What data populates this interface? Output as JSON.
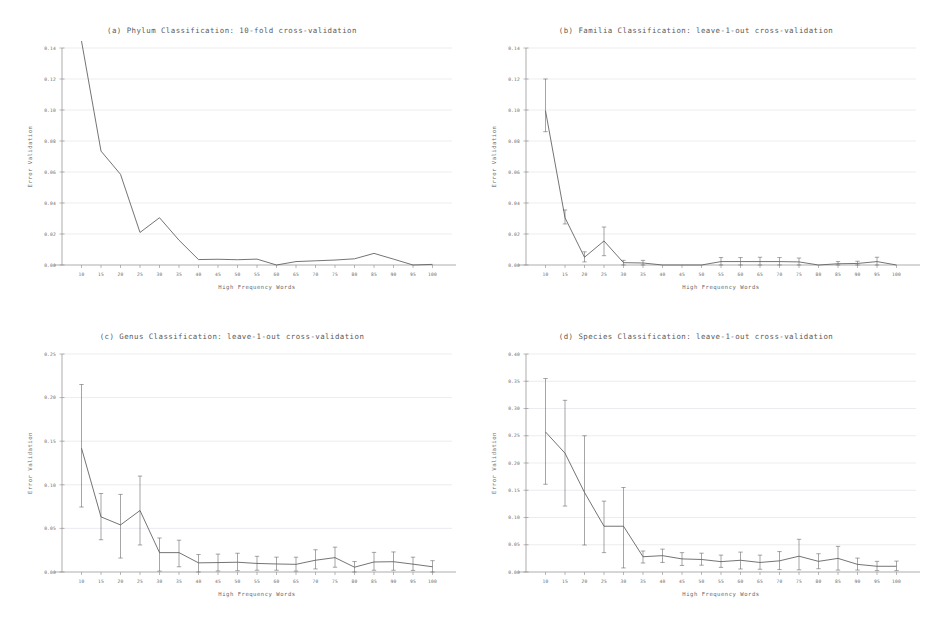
{
  "figure": {
    "axis_x_label": "High Frequency Words",
    "axis_y_label": "Error Validation",
    "x_ticks": [
      10,
      15,
      20,
      25,
      30,
      35,
      40,
      45,
      50,
      55,
      60,
      65,
      70,
      75,
      80,
      85,
      90,
      95,
      100
    ],
    "line_color": "#5b5b5b",
    "grid_color": "#c9cfd6",
    "axis_color": "#8a8a8a"
  },
  "chart_data": [
    {
      "id": "panel-a",
      "type": "line",
      "title": "(a) Phylum Classification: 10-fold cross-validation",
      "xlabel": "High Frequency Words",
      "ylabel": "Error Validation",
      "x": [
        10,
        15,
        20,
        25,
        30,
        35,
        40,
        45,
        50,
        55,
        60,
        65,
        70,
        75,
        80,
        85,
        90,
        95,
        100
      ],
      "values": [
        0.1445,
        0.0735,
        0.0585,
        0.021,
        0.0305,
        0.016,
        0.0035,
        0.0037,
        0.0034,
        0.0038,
        0.0,
        0.0022,
        0.0027,
        0.0032,
        0.004,
        0.0075,
        0.0038,
        0.0,
        0.0004
      ],
      "errors": null,
      "xlim": [
        5,
        105
      ],
      "ylim": [
        0.0,
        0.14
      ],
      "y_ticks": [
        0.0,
        0.02,
        0.04,
        0.06,
        0.08,
        0.1,
        0.12,
        0.14
      ],
      "y_tick_labels": [
        "0.00",
        "0.02",
        "0.04",
        "0.06",
        "0.08",
        "0.10",
        "0.12",
        "0.14"
      ],
      "grid": true,
      "legend": "none"
    },
    {
      "id": "panel-b",
      "type": "line",
      "title": "(b) Familia Classification: leave-1-out cross-validation",
      "xlabel": "High Frequency Words",
      "ylabel": "Error Validation",
      "x": [
        10,
        15,
        20,
        25,
        30,
        35,
        40,
        45,
        50,
        55,
        60,
        65,
        70,
        75,
        80,
        85,
        90,
        95,
        100
      ],
      "values": [
        0.0995,
        0.0305,
        0.005,
        0.0155,
        0.0015,
        0.0013,
        0.0,
        0.0,
        0.0,
        0.0022,
        0.0022,
        0.0022,
        0.0022,
        0.002,
        0.0,
        0.0008,
        0.001,
        0.0022,
        0.0
      ],
      "errors": [
        [
          0.086,
          0.12
        ],
        [
          0.0265,
          0.0355
        ],
        [
          0.002,
          0.0085
        ],
        [
          0.006,
          0.0245
        ],
        [
          0.0,
          0.003
        ],
        [
          0.0,
          0.003
        ],
        [
          0.0,
          0.0
        ],
        [
          0.0,
          0.0
        ],
        [
          0.0,
          0.0
        ],
        [
          0.0,
          0.0048
        ],
        [
          0.0,
          0.0048
        ],
        [
          0.0,
          0.005
        ],
        [
          0.0,
          0.0048
        ],
        [
          0.0,
          0.0045
        ],
        [
          0.0,
          0.0
        ],
        [
          0.0,
          0.0022
        ],
        [
          0.0,
          0.0024
        ],
        [
          0.0,
          0.005
        ],
        [
          0.0,
          0.0
        ]
      ],
      "xlim": [
        5,
        105
      ],
      "ylim": [
        0.0,
        0.14
      ],
      "y_ticks": [
        0.0,
        0.02,
        0.04,
        0.06,
        0.08,
        0.1,
        0.12,
        0.14
      ],
      "y_tick_labels": [
        "0.00",
        "0.02",
        "0.04",
        "0.06",
        "0.08",
        "0.10",
        "0.12",
        "0.14"
      ],
      "grid": true,
      "legend": "none"
    },
    {
      "id": "panel-c",
      "type": "line",
      "title": "(c) Genus Classification: leave-1-out cross-validation",
      "xlabel": "High Frequency Words",
      "ylabel": "Error Validation",
      "x": [
        10,
        15,
        20,
        25,
        30,
        35,
        40,
        45,
        50,
        55,
        60,
        65,
        70,
        75,
        80,
        85,
        90,
        95,
        100
      ],
      "values": [
        0.142,
        0.0632,
        0.054,
        0.0705,
        0.0222,
        0.0222,
        0.0105,
        0.0108,
        0.0112,
        0.0098,
        0.0092,
        0.0088,
        0.0135,
        0.0165,
        0.0055,
        0.0115,
        0.0118,
        0.009,
        0.006
      ],
      "errors": [
        [
          0.0745,
          0.215
        ],
        [
          0.037,
          0.09
        ],
        [
          0.016,
          0.089
        ],
        [
          0.031,
          0.11
        ],
        [
          0.001,
          0.039
        ],
        [
          0.006,
          0.0365
        ],
        [
          0.0,
          0.02
        ],
        [
          0.0012,
          0.0205
        ],
        [
          0.0015,
          0.0215
        ],
        [
          0.002,
          0.018
        ],
        [
          0.002,
          0.017
        ],
        [
          0.001,
          0.017
        ],
        [
          0.0035,
          0.0255
        ],
        [
          0.0055,
          0.0285
        ],
        [
          0.0,
          0.012
        ],
        [
          0.002,
          0.0225
        ],
        [
          0.002,
          0.023
        ],
        [
          0.0018,
          0.017
        ],
        [
          0.0,
          0.013
        ]
      ],
      "xlim": [
        5,
        105
      ],
      "ylim": [
        0.0,
        0.25
      ],
      "y_ticks": [
        0.0,
        0.05,
        0.1,
        0.15,
        0.2,
        0.25
      ],
      "y_tick_labels": [
        "0.00",
        "0.05",
        "0.10",
        "0.15",
        "0.20",
        "0.25"
      ],
      "grid": true,
      "legend": "none"
    },
    {
      "id": "panel-d",
      "type": "line",
      "title": "(d) Species Classification: leave-1-out cross-validation",
      "xlabel": "High Frequency Words",
      "ylabel": "Error Validation",
      "x": [
        10,
        15,
        20,
        25,
        30,
        35,
        40,
        45,
        50,
        55,
        60,
        65,
        70,
        75,
        80,
        85,
        90,
        95,
        100
      ],
      "values": [
        0.257,
        0.218,
        0.146,
        0.084,
        0.084,
        0.028,
        0.03,
        0.024,
        0.023,
        0.019,
        0.0215,
        0.0175,
        0.0205,
        0.029,
        0.0195,
        0.025,
        0.014,
        0.0105,
        0.0105
      ],
      "errors": [
        [
          0.161,
          0.355
        ],
        [
          0.121,
          0.315
        ],
        [
          0.0495,
          0.25
        ],
        [
          0.0355,
          0.13
        ],
        [
          0.0075,
          0.155
        ],
        [
          0.0165,
          0.0385
        ],
        [
          0.0175,
          0.042
        ],
        [
          0.012,
          0.0355
        ],
        [
          0.0125,
          0.0345
        ],
        [
          0.0085,
          0.031
        ],
        [
          0.0055,
          0.0365
        ],
        [
          0.005,
          0.031
        ],
        [
          0.0045,
          0.0375
        ],
        [
          0.004,
          0.06
        ],
        [
          0.006,
          0.0335
        ],
        [
          0.0035,
          0.047
        ],
        [
          0.0035,
          0.0255
        ],
        [
          0.0025,
          0.0195
        ],
        [
          0.0025,
          0.02
        ]
      ],
      "xlim": [
        5,
        105
      ],
      "ylim": [
        0.0,
        0.4
      ],
      "y_ticks": [
        0.0,
        0.05,
        0.1,
        0.15,
        0.2,
        0.25,
        0.3,
        0.35,
        0.4
      ],
      "y_tick_labels": [
        "0.00",
        "0.05",
        "0.10",
        "0.15",
        "0.20",
        "0.25",
        "0.30",
        "0.35",
        "0.40"
      ],
      "grid": true,
      "legend": "none"
    }
  ]
}
